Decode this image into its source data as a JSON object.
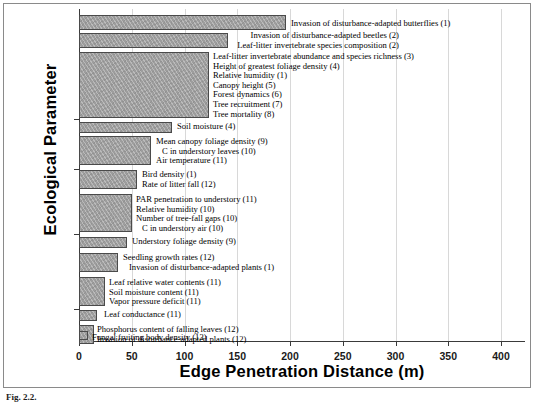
{
  "chart_data": {
    "type": "bar",
    "orientation": "horizontal",
    "title": "",
    "xlabel": "Edge Penetration Distance (m)",
    "ylabel": "Ecological Parameter",
    "xlim": [
      0,
      400
    ],
    "ylim": null,
    "grid": true,
    "gridlines_axis": "x",
    "legend": "none",
    "xticks": [
      0,
      50,
      100,
      150,
      200,
      250,
      300,
      350,
      400
    ],
    "xticklabels": [
      "0",
      "50",
      "100",
      "150",
      "200",
      "250",
      "300",
      "350",
      "400"
    ],
    "categories": [
      "Invasion of disturbance-adapted butterflies (1)",
      "Invasion of disturbance-adapted beetles  (2) / Leaf-litter invertebrate species composition (2)",
      "Leaf-litter invertebrate abundance and species richness (3) / Height of greatest foliage density (4) / Relative humidity (1) / Canopy height (5) / Forest dynamics (6) / Tree recruitment (7) / Tree mortality (8)",
      "Soil moisture (4)",
      "Mean canopy foliage density (9) / C in understory leaves (10) / Air temperature (11)",
      "Bird density (1) / Rate of litter fall (12)",
      "PAR penetration to understory (11) / Relative humidity (10) / Number of tree-fall gaps (10) / C in understory air (10)",
      "Understory foliage density (9)",
      "Seedling growth rates (12) / Invasion of disturbance-adapted plants (1)",
      "Leaf relative water contents (11) / Soil moisture content (11) / Vapor pressure deficit (11)",
      "Leaf conductance (11)",
      "Phosphorus content of falling leaves (12) / Invasion of disturbance-adapted plants (12)",
      "Fungal fruiting body density (13)"
    ],
    "values": [
      250,
      200,
      180,
      90,
      80,
      70,
      60,
      50,
      40,
      30,
      20,
      15,
      5
    ],
    "bars": [
      {
        "value": 250,
        "px_left": 0,
        "px_width": 207,
        "px_top": 6,
        "px_height": 15,
        "labels": [
          "Invasion of disturbance-adapted butterflies (1)"
        ],
        "label_align": "left",
        "label_x": 212,
        "label_y": 10
      },
      {
        "value": 200,
        "px_left": 0,
        "px_width": 149,
        "px_top": 24,
        "px_height": 15,
        "labels": [
          "Invasion of disturbance-adapted beetles  (2)",
          "Leaf-litter invertebrate species composition (2)"
        ],
        "label_align": "right",
        "label_x": 0,
        "label_y": 22,
        "label_width": 320
      },
      {
        "value": 180,
        "px_left": 0,
        "px_width": 130,
        "px_top": 43,
        "px_height": 66,
        "labels": [
          "Leaf-litter invertebrate abundance and species richness (3)",
          "Height of greatest foliage density (4)",
          "Relative humidity (1)",
          "Canopy height (5)",
          "Forest dynamics (6)",
          "Tree recruitment (7)",
          "Tree mortality (8)"
        ],
        "label_align": "left",
        "label_x": 134,
        "label_y": 43
      },
      {
        "value": 90,
        "px_left": 0,
        "px_width": 93,
        "px_top": 113,
        "px_height": 11,
        "labels": [
          "Soil moisture (4)"
        ],
        "label_align": "left",
        "label_x": 98,
        "label_y": 113
      },
      {
        "value": 80,
        "px_left": 0,
        "px_width": 72,
        "px_top": 127,
        "px_height": 29,
        "labels": [
          "Mean canopy foliage density (9)",
          "C in understory leaves (10)",
          "Air temperature (11)"
        ],
        "label_align": "left",
        "label_x": 77,
        "label_y": 128,
        "indents": [
          0,
          1,
          0
        ]
      },
      {
        "value": 70,
        "px_left": 0,
        "px_width": 58,
        "px_top": 161,
        "px_height": 19,
        "labels": [
          "Bird density (1)",
          "Rate of  litter fall (12)"
        ],
        "label_align": "left",
        "label_x": 63,
        "label_y": 161
      },
      {
        "value": 60,
        "px_left": 0,
        "px_width": 53,
        "px_top": 185,
        "px_height": 38,
        "labels": [
          "PAR penetration to understory (11)",
          "Relative humidity (10)",
          "Number of tree-fall gaps (10)",
          "C in understory air (10)"
        ],
        "label_align": "left",
        "label_x": 57,
        "label_y": 186,
        "indents": [
          0,
          0,
          0,
          1
        ]
      },
      {
        "value": 50,
        "px_left": 0,
        "px_width": 48,
        "px_top": 228,
        "px_height": 11,
        "labels": [
          "Understory foliage density (9)"
        ],
        "label_align": "left",
        "label_x": 53,
        "label_y": 228
      },
      {
        "value": 40,
        "px_left": 0,
        "px_width": 39,
        "px_top": 244,
        "px_height": 19,
        "labels": [
          "Seedling growth rates (12)",
          "Invasion of disturbance-adapted plants (1)"
        ],
        "label_align": "left",
        "label_x": 44,
        "label_y": 244,
        "indents": [
          0,
          1
        ]
      },
      {
        "value": 30,
        "px_left": 0,
        "px_width": 26,
        "px_top": 268,
        "px_height": 29,
        "labels": [
          "Leaf relative water contents (11)",
          "Soil moisture content (11)",
          "Vapor pressure deficit (11)"
        ],
        "label_align": "left",
        "label_x": 30,
        "label_y": 269
      },
      {
        "value": 20,
        "px_left": 0,
        "px_width": 18,
        "px_top": 301,
        "px_height": 11,
        "labels": [
          "Leaf conductance (11)"
        ],
        "label_align": "left",
        "label_x": 25,
        "label_y": 301
      },
      {
        "value": 15,
        "px_left": 0,
        "px_width": 15,
        "px_top": 316,
        "px_height": 19,
        "labels": [
          "Phosphorus content of falling leaves (12)",
          "Invasion of disturbance-adapted plants (12)"
        ],
        "label_align": "left",
        "label_x": 18,
        "label_y": 316
      },
      {
        "value": 5,
        "px_left": 0,
        "px_width": 9,
        "px_top": 322,
        "px_height": 9,
        "labels": [
          "Fungal fruiting body density (13)"
        ],
        "label_align": "left",
        "label_x": 13,
        "label_y": 324
      }
    ],
    "ytick_positions_px": [
      110,
      160,
      225,
      300
    ],
    "bar_fill_color": "#9d9d9d",
    "bar_edge_color": "#4a4a4a",
    "gridline_color": "#d8d8d8",
    "axis_color": "#3a3a3a"
  },
  "caption": {
    "label": "Fig. 2.2.",
    "text": ""
  }
}
